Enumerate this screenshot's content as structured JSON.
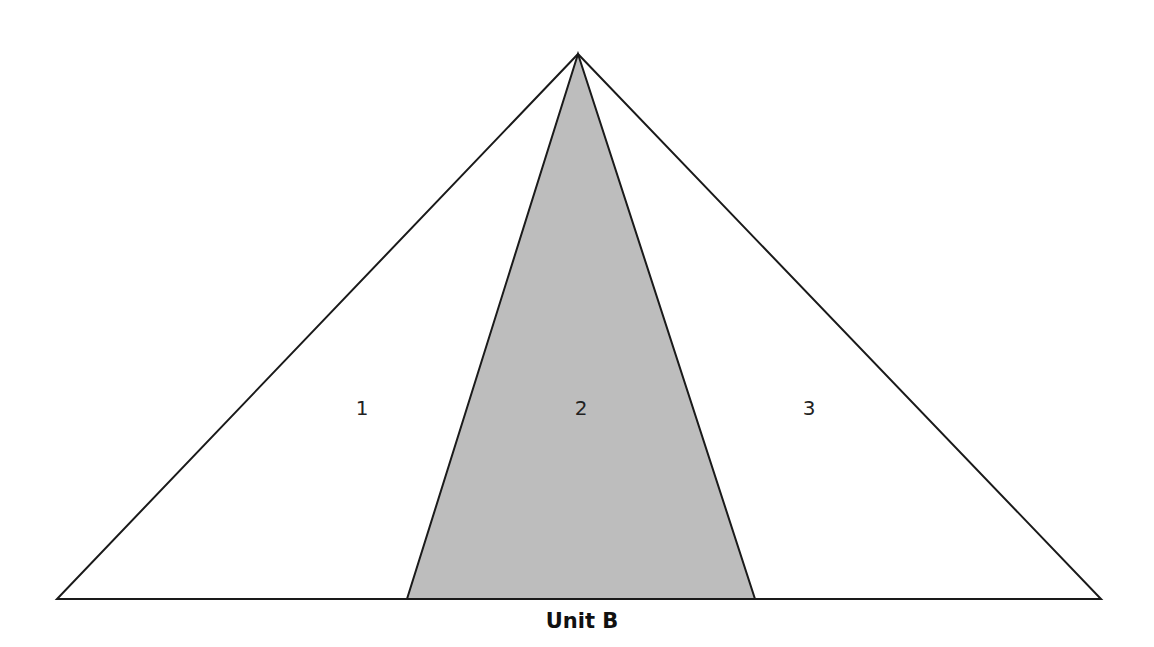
{
  "diagram": {
    "type": "triangle-partition",
    "caption": "Unit B",
    "outer_triangle": {
      "apex": [
        578,
        54
      ],
      "base_left": [
        57,
        599
      ],
      "base_right": [
        1101,
        599
      ],
      "fill": "#ffffff",
      "stroke": "#1a1a1a"
    },
    "shaded_region": {
      "apex": [
        578,
        54
      ],
      "base_left": [
        407,
        599
      ],
      "base_right": [
        755,
        599
      ],
      "fill": "#bdbdbd",
      "stroke": "#1a1a1a"
    },
    "regions": [
      {
        "id": "1",
        "label": "1",
        "shaded": false,
        "label_pos": [
          362,
          415
        ]
      },
      {
        "id": "2",
        "label": "2",
        "shaded": true,
        "label_pos": [
          581,
          415
        ]
      },
      {
        "id": "3",
        "label": "3",
        "shaded": false,
        "label_pos": [
          809,
          415
        ]
      }
    ]
  }
}
